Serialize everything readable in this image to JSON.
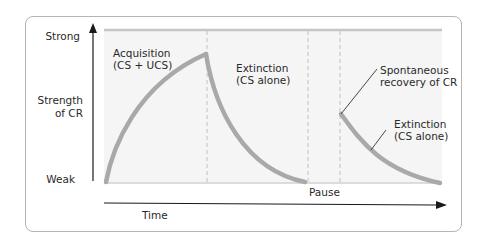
{
  "diagram": {
    "type": "conditioning-curve",
    "y_axis": {
      "top_label": "Strong",
      "middle_label_line1": "Strength",
      "middle_label_line2": "of CR",
      "bottom_label": "Weak"
    },
    "x_axis": {
      "label": "Time"
    },
    "phases": [
      {
        "line1": "Acquisition",
        "line2": "(CS + UCS)"
      },
      {
        "line1": "Extinction",
        "line2": "(CS alone)"
      },
      {
        "line1": "Pause",
        "line2": ""
      },
      {
        "line1": "Spontaneous",
        "line2": "recovery of CR"
      },
      {
        "line1": "Extinction",
        "line2": "(CS alone)"
      }
    ],
    "colors": {
      "curve": "#a9a9a9",
      "plot_background": "#f4f4f4",
      "top_reference_line": "#c8c8c8",
      "divider": "#c0c0c0",
      "axis": "#1a1a1a",
      "frame_border": "#b5b5b5"
    }
  }
}
